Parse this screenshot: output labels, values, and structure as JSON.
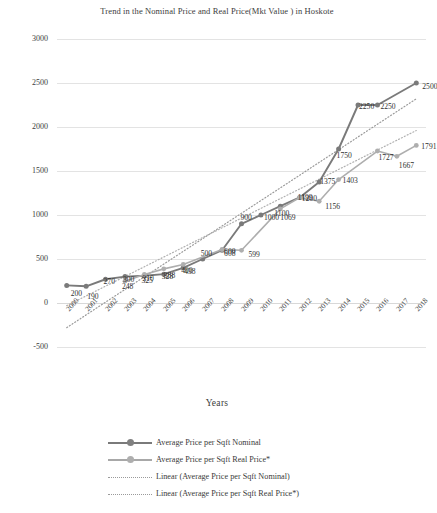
{
  "chart_data": {
    "type": "line",
    "title": "Trend in the Nominal Price and Real Price(Mkt Value ) in Hoskote",
    "xlabel": "Years",
    "ylabel": "Land value",
    "ylim": [
      -500,
      3000
    ],
    "yticks": [
      3000,
      2500,
      2000,
      1500,
      1000,
      500,
      0,
      -500
    ],
    "grid": true,
    "legend_position": "bottom",
    "categories": [
      "2000",
      "2001",
      "2002",
      "2003",
      "2004",
      "2005",
      "2006",
      "2007",
      "2008",
      "2009",
      "2010",
      "2011",
      "2012",
      "2013",
      "2014",
      "2015",
      "2016",
      "2017",
      "2018"
    ],
    "series": [
      {
        "name": "Average Price per Sqft Nominal",
        "style": "solid",
        "color": "#7a7a7a",
        "marker": "circle",
        "values": [
          200,
          190,
          270,
          300,
          310,
          328,
          400,
          500,
          600,
          900,
          1000,
          1100,
          1200,
          1375,
          1750,
          2250,
          2250,
          null,
          2500
        ],
        "labels": [
          "200",
          "190",
          "270",
          "300",
          "310",
          "328",
          "400",
          "500",
          "600",
          "900",
          "1000",
          "1100",
          "1200",
          "1375",
          "1750",
          "2250",
          "2250",
          "",
          "2500"
        ]
      },
      {
        "name": "Average Price per Sqft Real Price*",
        "style": "solid",
        "color": "#aeaeae",
        "marker": "circle",
        "values": [
          null,
          null,
          null,
          248,
          325,
          388,
          438,
          null,
          608,
          599,
          null,
          1069,
          1199,
          1156,
          1403,
          null,
          1727,
          1667,
          1791
        ],
        "labels": [
          "",
          "",
          "",
          "248",
          "325",
          "388",
          "438",
          "",
          "608",
          "599",
          "",
          "1069",
          "1199",
          "1156",
          "1403",
          "",
          "1727",
          "1667",
          "1791"
        ]
      },
      {
        "name": "Linear (Average Price per Sqft Nominal)",
        "style": "dotted",
        "color": "#9a9a9a",
        "trendline_for": "Average Price per Sqft Nominal",
        "endpoints": [
          -280,
          2320
        ]
      },
      {
        "name": "Linear (Average Price per Sqft Real Price*)",
        "style": "dotted",
        "color": "#b0b0b0",
        "trendline_for": "Average Price per Sqft Real Price*",
        "endpoints": [
          -30,
          1960
        ]
      }
    ],
    "legend": [
      "Average Price per Sqft Nominal",
      "Average Price per Sqft Real Price*",
      "Linear (Average Price per Sqft Nominal)",
      "Linear (Average Price per Sqft Real Price*)"
    ]
  }
}
